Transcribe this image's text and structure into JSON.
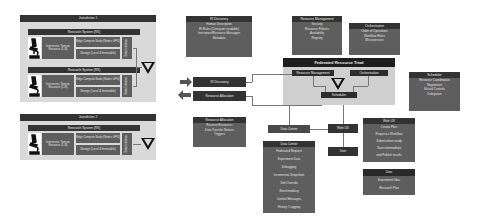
{
  "jurisdiction1": {
    "title": "Jurisdiction 1",
    "systems": [
      {
        "title": "Research System (RS)",
        "instrument": "Instrument, Sensor, Resource (1-N)",
        "edge": "Edge Compute Node (Nodes GPU)",
        "storage": "Storage (Local & Immutable)",
        "state": "State Initiation"
      },
      {
        "title": "Research System (RS)",
        "instrument": "Instrument, Sensor, Resource (1-N)",
        "edge": "Edge Compute Node (Nodes GPU)",
        "storage": "Storage (Local & Immutable)",
        "state": "State Initiation"
      }
    ]
  },
  "jurisdiction2": {
    "title": "Jurisdiction 2",
    "systems": [
      {
        "title": "Research System (RS)",
        "instrument": "Instrument, Sensor, Resource (1-N)",
        "edge": "Edge Compute Node (Nodes GPU)",
        "storage": "Storage (Local & Immutable)",
        "state": "State Initiation"
      }
    ]
  },
  "ri_discovery_box": {
    "title": "RI Discovery",
    "items": [
      "Human Description",
      "RI Rules (Computer readable)",
      "Instrument/Resource Messages",
      "Metadata"
    ]
  },
  "resource_management_box": {
    "title": "Resource Management",
    "items": [
      "Security",
      "Resource Policies",
      "Availability",
      "Registry"
    ]
  },
  "orchestration_box": {
    "title": "Orchestration",
    "items": [
      "Order of Operations",
      "Workflow Rules",
      "Microservices"
    ]
  },
  "triad": {
    "title": "Federated Resource Triad",
    "resource_management": "Resource Management",
    "orchestration": "Orchestration",
    "scheduler": "Scheduler"
  },
  "side_buttons": {
    "ri_discovery": "RI Discovery",
    "resource_allocation": "Resource Allocation"
  },
  "resource_allocation_box": {
    "title": "Resource Allocation",
    "items": [
      "Reserve Resources",
      "Data Transfer Notices",
      "Triggers"
    ]
  },
  "scheduler_box": {
    "title": "Scheduler",
    "items": [
      "Resource Coordination",
      "Negotiation",
      "Mutual Controls",
      "Delegation"
    ]
  },
  "data_center": {
    "label": "Data Center"
  },
  "web_ux": {
    "label": "Web UX"
  },
  "user": {
    "label": "User"
  },
  "data_center_box": {
    "title": "Data Center",
    "items": [
      "Federated Request",
      "Experiment Data",
      "Debugging",
      "Incremental Snapshots",
      "Soft Override",
      "Benchmarking",
      "Control Messages",
      "History / Logging"
    ]
  },
  "web_ux_box": {
    "title": "Web UX",
    "items": [
      "Create Plan",
      "Request a Workflow",
      "Submit when ready",
      "Save intermediate",
      "and Publish results"
    ]
  },
  "user_box": {
    "title": "User",
    "items": [
      "Experiment Idea",
      "Research Plan"
    ]
  }
}
